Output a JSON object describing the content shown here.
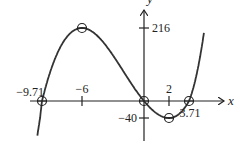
{
  "chart_data": {
    "type": "line",
    "title": "",
    "xlabel": "x",
    "ylabel": "y",
    "function": "cubic with local max at (-6, 216), local min at (2, -40), x-intercepts at -9.71, 0, 3.71",
    "x_ticks": [
      {
        "value": -6,
        "label": "−6"
      },
      {
        "value": 2,
        "label": "2"
      }
    ],
    "y_ticks": [
      {
        "value": 216,
        "label": "216"
      },
      {
        "value": -40,
        "label": "−40"
      }
    ],
    "intercept_labels": [
      {
        "value": -9.71,
        "label": "−9.71"
      },
      {
        "value": 3.71,
        "label": "3.71"
      }
    ],
    "marked_points": [
      {
        "name": "x-intercept",
        "x": -9.71,
        "y": 0
      },
      {
        "name": "local-max",
        "x": -6,
        "y": 216
      },
      {
        "name": "origin",
        "x": 0,
        "y": 0
      },
      {
        "name": "local-min",
        "x": 2,
        "y": -40
      },
      {
        "name": "x-intercept",
        "x": 3.71,
        "y": 0
      }
    ],
    "grid": false,
    "legend": null,
    "colors": {
      "curve": "#333333",
      "axes": "#222222"
    }
  }
}
